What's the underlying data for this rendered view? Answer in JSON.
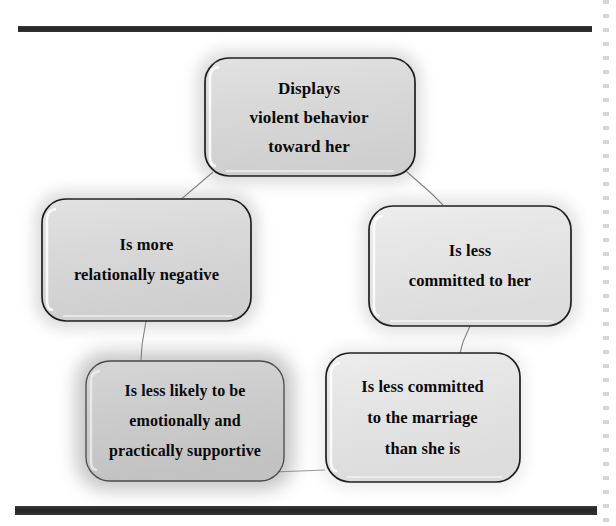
{
  "figure": {
    "type": "cycle-diagram",
    "node_count": 5,
    "ink_color": "#1a1a1a",
    "box_fill_light": "#e4e4e4",
    "box_fill_dark": "#c8c8c8",
    "rule_color": "#2e2e2e"
  },
  "nodes": [
    {
      "id": "violence",
      "position": "top",
      "lines": [
        "Displays",
        "violent behavior",
        "toward her"
      ]
    },
    {
      "id": "negative",
      "position": "left",
      "lines": [
        "Is more",
        "relationally negative"
      ]
    },
    {
      "id": "uncommitted_her",
      "position": "right",
      "lines": [
        "Is less",
        "committed to her"
      ]
    },
    {
      "id": "unsupportive",
      "position": "bottom-left",
      "lines": [
        "Is less likely to be",
        "emotionally and",
        "practically supportive"
      ]
    },
    {
      "id": "uncommitted_marriage",
      "position": "bottom-right",
      "lines": [
        "Is less committed",
        "to the marriage",
        "than she is"
      ]
    }
  ],
  "connectors": [
    {
      "from": "violence",
      "to": "negative"
    },
    {
      "from": "violence",
      "to": "uncommitted_her"
    },
    {
      "from": "negative",
      "to": "unsupportive"
    },
    {
      "from": "uncommitted_her",
      "to": "uncommitted_marriage"
    },
    {
      "from": "unsupportive",
      "to": "uncommitted_marriage"
    }
  ],
  "rules": {
    "top_rule": "",
    "bottom_rule": ""
  }
}
